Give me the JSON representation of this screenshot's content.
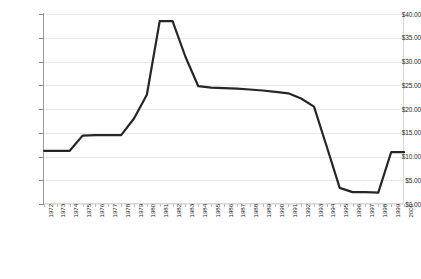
{
  "chart_data": {
    "type": "line",
    "title": "",
    "xlabel": "",
    "ylabel": "",
    "ylim": [
      0,
      40
    ],
    "ytick_step": 5,
    "grid": true,
    "legend": "none",
    "line_color": "#262626",
    "categories": [
      "1972",
      "1973",
      "1974",
      "1975",
      "1976",
      "1977",
      "1978",
      "1979",
      "1980",
      "1981",
      "1982",
      "1983",
      "1984",
      "1985",
      "1986",
      "1987",
      "1988",
      "1989",
      "1990",
      "1991",
      "1992",
      "1993",
      "1994",
      "1995",
      "1996",
      "1997",
      "1998",
      "1999",
      "2000"
    ],
    "ytick_labels": [
      "$40.00",
      "$35.00",
      "$30.00",
      "$25.00",
      "$20.00",
      "$15.00",
      "$10.00",
      "$5.00",
      "$0.00"
    ],
    "ytick_values": [
      40,
      35,
      30,
      25,
      20,
      15,
      10,
      5,
      0
    ],
    "series": [
      {
        "name": "price",
        "values": [
          11.2,
          11.2,
          11.2,
          14.4,
          14.5,
          14.5,
          14.5,
          18.0,
          23.0,
          38.5,
          38.5,
          31.0,
          24.8,
          24.5,
          24.4,
          24.3,
          24.1,
          23.9,
          23.6,
          23.3,
          22.2,
          20.5,
          12.0,
          3.4,
          2.5,
          2.5,
          2.4,
          10.9,
          10.9
        ]
      }
    ]
  }
}
